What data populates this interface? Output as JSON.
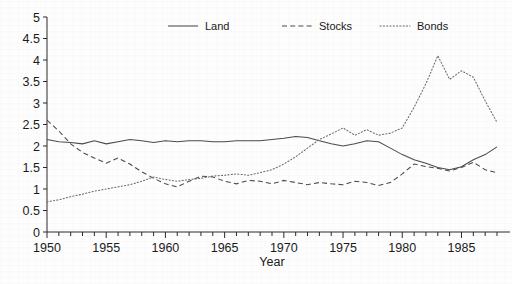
{
  "chart_data": {
    "type": "line",
    "title": "",
    "xlabel": "Year",
    "ylabel": "",
    "xlim": [
      1950,
      1988
    ],
    "ylim": [
      0,
      5
    ],
    "grid": false,
    "legend_position": "top-center",
    "y_ticks": [
      "0",
      "0.5",
      "1",
      "1.5",
      "2",
      "2.5",
      "3",
      "3.5",
      "4",
      "4.5",
      "5"
    ],
    "y_tick_values": [
      0,
      0.5,
      1,
      1.5,
      2,
      2.5,
      3,
      3.5,
      4,
      4.5,
      5
    ],
    "x_ticks": [
      "1950",
      "1955",
      "1960",
      "1965",
      "1970",
      "1975",
      "1980",
      "1985"
    ],
    "x_tick_values": [
      1950,
      1955,
      1960,
      1965,
      1970,
      1975,
      1980,
      1985
    ],
    "x_minor_tick_interval": 1,
    "x": [
      1950,
      1951,
      1952,
      1953,
      1954,
      1955,
      1956,
      1957,
      1958,
      1959,
      1960,
      1961,
      1962,
      1963,
      1964,
      1965,
      1966,
      1967,
      1968,
      1969,
      1970,
      1971,
      1972,
      1973,
      1974,
      1975,
      1976,
      1977,
      1978,
      1979,
      1980,
      1981,
      1982,
      1983,
      1984,
      1985,
      1986,
      1987,
      1988
    ],
    "series": [
      {
        "name": "Land",
        "style": "solid",
        "color": "#4a4a4a",
        "values": [
          2.15,
          2.1,
          2.08,
          2.05,
          2.12,
          2.05,
          2.1,
          2.15,
          2.12,
          2.08,
          2.12,
          2.1,
          2.12,
          2.12,
          2.1,
          2.1,
          2.12,
          2.12,
          2.12,
          2.15,
          2.18,
          2.22,
          2.2,
          2.12,
          2.05,
          2.0,
          2.05,
          2.12,
          2.1,
          1.95,
          1.8,
          1.68,
          1.6,
          1.5,
          1.45,
          1.52,
          1.68,
          1.8,
          1.98
        ]
      },
      {
        "name": "Stocks",
        "style": "dashed",
        "color": "#4a4a4a",
        "values": [
          2.6,
          2.35,
          2.05,
          1.85,
          1.72,
          1.6,
          1.72,
          1.58,
          1.4,
          1.25,
          1.12,
          1.05,
          1.18,
          1.3,
          1.28,
          1.18,
          1.12,
          1.2,
          1.18,
          1.12,
          1.2,
          1.15,
          1.1,
          1.15,
          1.12,
          1.1,
          1.18,
          1.15,
          1.08,
          1.15,
          1.35,
          1.58,
          1.52,
          1.48,
          1.42,
          1.5,
          1.62,
          1.45,
          1.38
        ]
      },
      {
        "name": "Bonds",
        "style": "dotted",
        "color": "#6b6b6b",
        "values": [
          0.7,
          0.75,
          0.82,
          0.88,
          0.95,
          1.0,
          1.05,
          1.1,
          1.18,
          1.28,
          1.22,
          1.18,
          1.22,
          1.25,
          1.3,
          1.32,
          1.35,
          1.32,
          1.38,
          1.45,
          1.58,
          1.75,
          1.95,
          2.15,
          2.28,
          2.42,
          2.25,
          2.38,
          2.25,
          2.3,
          2.42,
          2.9,
          3.45,
          4.1,
          3.55,
          3.75,
          3.6,
          3.05,
          2.55
        ]
      }
    ],
    "legend": [
      {
        "label": "Land",
        "style": "solid"
      },
      {
        "label": "Stocks",
        "style": "dashed"
      },
      {
        "label": "Bonds",
        "style": "dotted"
      }
    ]
  }
}
